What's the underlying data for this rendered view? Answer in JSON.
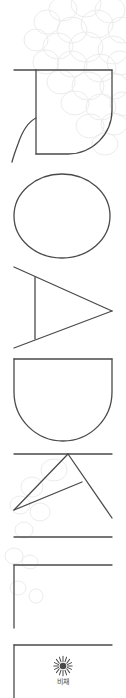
{
  "spine": {
    "title_text": "ROADKILL",
    "letters": [
      {
        "char": "R",
        "name": "spine-letter-r"
      },
      {
        "char": "O",
        "name": "spine-letter-o"
      },
      {
        "char": "A",
        "name": "spine-letter-a"
      },
      {
        "char": "D",
        "name": "spine-letter-d"
      },
      {
        "char": "K",
        "name": "spine-letter-k"
      },
      {
        "char": "I",
        "name": "spine-letter-i"
      },
      {
        "char": "L",
        "name": "spine-letter-l1"
      },
      {
        "char": "L",
        "name": "spine-letter-l2"
      }
    ],
    "orientation": "rotated-90-ccw",
    "style": "outline"
  },
  "imprint": {
    "name": "비채",
    "mark": "sunburst-icon"
  },
  "decoration": {
    "watermark": "grape-cluster-circles"
  },
  "colors": {
    "background": "#ffffff",
    "stroke": "#4a4a4a",
    "watermark_stroke": "#ececed",
    "imprint_text": "#4a4a4a"
  }
}
